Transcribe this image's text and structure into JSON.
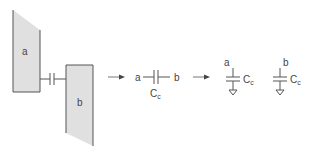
{
  "diagram": {
    "plates": [
      {
        "id": "a",
        "label": "a"
      },
      {
        "id": "b",
        "label": "b"
      }
    ],
    "series_cap": {
      "left_label": "a",
      "right_label": "b",
      "cap_label": "C",
      "cap_subscript": "c"
    },
    "grounded_caps": [
      {
        "node_label": "a",
        "cap_label": "C",
        "cap_subscript": "c"
      },
      {
        "node_label": "b",
        "cap_label": "C",
        "cap_subscript": "c"
      }
    ],
    "arrows": [
      {
        "from": "physical-plates",
        "to": "coupling-capacitor"
      },
      {
        "from": "coupling-capacitor",
        "to": "grounded-capacitors"
      }
    ],
    "colors": {
      "plate_fill": "#e0e0e0",
      "stroke": "#555555",
      "text": "#444444"
    }
  }
}
